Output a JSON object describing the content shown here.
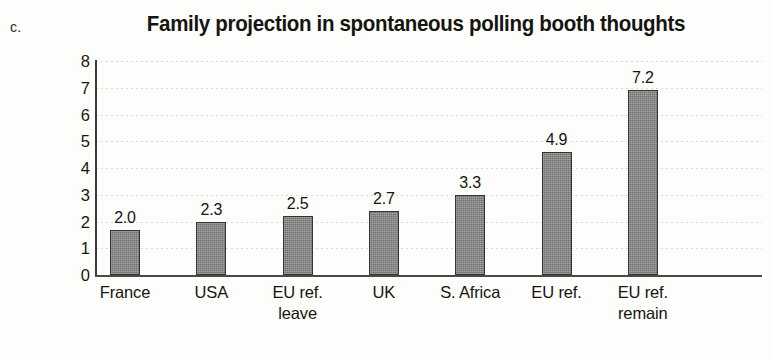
{
  "panel_label": "c.",
  "chart_data": {
    "type": "bar",
    "title": "Family projection in spontaneous polling booth thoughts",
    "xlabel": "",
    "ylabel": "",
    "categories": [
      "France",
      "USA",
      "EU ref. leave",
      "UK",
      "S. Africa",
      "EU ref.",
      "EU ref. remain"
    ],
    "category_lines": [
      [
        "France"
      ],
      [
        "USA"
      ],
      [
        "EU ref.",
        "leave"
      ],
      [
        "UK"
      ],
      [
        "S. Africa"
      ],
      [
        "EU ref."
      ],
      [
        "EU ref.",
        "remain"
      ]
    ],
    "values": [
      2.0,
      2.3,
      2.5,
      2.7,
      3.3,
      4.9,
      7.2
    ],
    "value_labels": [
      "2.0",
      "2.3",
      "2.5",
      "2.7",
      "3.3",
      "4.9",
      "7.2"
    ],
    "ylim": [
      0,
      8
    ],
    "y_ticks": [
      "0",
      "1",
      "2",
      "3",
      "4",
      "5",
      "6",
      "7",
      "8"
    ],
    "grid": true,
    "legend": "none",
    "bar_color": "#7e7e7c",
    "bar_border_color": "#35352f",
    "grid_color": "#d9d9d4",
    "axis_color": "#4a4a46",
    "text_color": "#15150f",
    "background": "#fdfdfb"
  }
}
